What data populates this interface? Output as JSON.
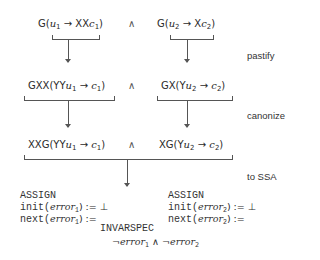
{
  "diagram": {
    "steps": [
      {
        "label": "pastify"
      },
      {
        "label": "canonize"
      },
      {
        "label": "to SSA"
      }
    ],
    "conjunction": "∧",
    "row1": {
      "left": {
        "op": "G(",
        "var": "u",
        "var_sub": "1",
        "arrow": " → XX",
        "res": "c",
        "res_sub": "1",
        "close": ")"
      },
      "right": {
        "op": "G(",
        "var": "u",
        "var_sub": "2",
        "arrow": " → X",
        "res": "c",
        "res_sub": "2",
        "close": ")"
      }
    },
    "row2": {
      "left": {
        "op": "GXX(YY",
        "var": "u",
        "var_sub": "1",
        "arrow": " → ",
        "res": "c",
        "res_sub": "1",
        "close": ")"
      },
      "right": {
        "op": "GX(Y",
        "var": "u",
        "var_sub": "2",
        "arrow": " → ",
        "res": "c",
        "res_sub": "2",
        "close": ")"
      }
    },
    "row3": {
      "left": {
        "op": "XXG(YY",
        "var": "u",
        "var_sub": "1",
        "arrow": " → ",
        "res": "c",
        "res_sub": "1",
        "close": ")"
      },
      "right": {
        "op": "XG(Y",
        "var": "u",
        "var_sub": "2",
        "arrow": " → ",
        "res": "c",
        "res_sub": "2",
        "close": ")"
      }
    },
    "smv": {
      "left": {
        "keyword": "ASSIGN",
        "init_kw": "init(",
        "init_var": "error",
        "init_sub": "1",
        "init_rest": ") := ⊥",
        "next_kw": "next(",
        "next_var": "error",
        "next_sub": "1",
        "next_rest": ") :="
      },
      "right": {
        "keyword": "ASSIGN",
        "init_kw": "init(",
        "init_var": "error",
        "init_sub": "2",
        "init_rest": ") := ⊥",
        "next_kw": "next(",
        "next_var": "error",
        "next_sub": "2",
        "next_rest": ") :="
      },
      "invarspec": {
        "keyword": "INVARSPEC",
        "neg": "¬",
        "var1": "error",
        "sub1": "1",
        "and": " ∧ ",
        "var2": "error",
        "sub2": "2"
      }
    }
  }
}
